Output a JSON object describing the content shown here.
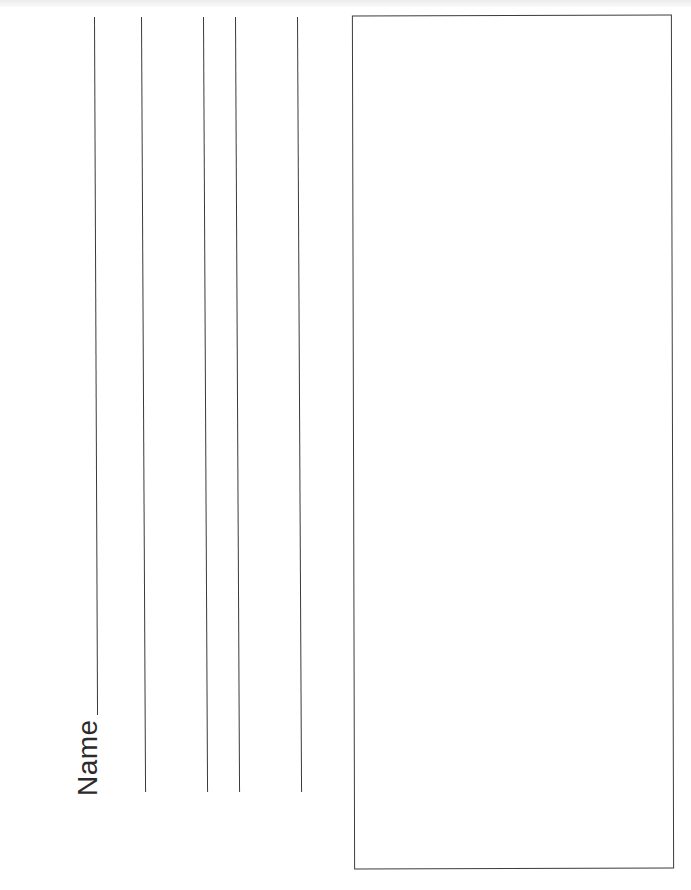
{
  "worksheet": {
    "orientation": "rotated-90",
    "name_field": {
      "label": "Name"
    },
    "writing_lines": [
      {
        "id": "name-line",
        "x_top": 94,
        "y_top": 17,
        "x_bottom": 97,
        "y_bottom": 715
      },
      {
        "id": "line-2",
        "x_top": 141,
        "y_top": 17,
        "x_bottom": 145,
        "y_bottom": 792
      },
      {
        "id": "line-3",
        "x_top": 203,
        "y_top": 17,
        "x_bottom": 207,
        "y_bottom": 792
      },
      {
        "id": "line-4",
        "x_top": 235,
        "y_top": 17,
        "x_bottom": 239,
        "y_bottom": 792
      },
      {
        "id": "line-5",
        "x_top": 297,
        "y_top": 17,
        "x_bottom": 301,
        "y_bottom": 792
      }
    ],
    "drawing_box": {
      "content": ""
    },
    "colors": {
      "ink": "#3a3a3a",
      "paper": "#ffffff"
    }
  }
}
